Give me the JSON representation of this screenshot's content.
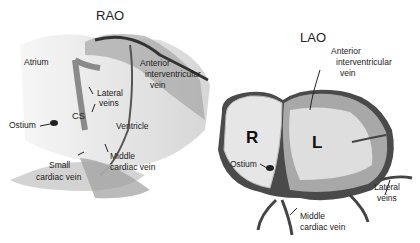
{
  "panels": [
    {
      "title": "RAO",
      "labels": {
        "atrium": "Atrium",
        "anterior_iv_vein_1": "Anterior",
        "anterior_iv_vein_2": "interventricular",
        "anterior_iv_vein_3": "vein",
        "lateral_veins_1": "Lateral",
        "lateral_veins_2": "veins",
        "cs": "CS",
        "ostium": "Ostium",
        "ventricle": "Ventricle",
        "middle_cardiac_1": "Middle",
        "middle_cardiac_2": "cardiac vein",
        "small_cardiac_1": "Small",
        "small_cardiac_2": "cardiac vein"
      }
    },
    {
      "title": "LAO",
      "labels": {
        "anterior_iv_vein_1": "Anterior",
        "anterior_iv_vein_2": "interventricular",
        "anterior_iv_vein_3": "vein",
        "right": "R",
        "left": "L",
        "ostium": "Ostium",
        "lateral_veins_1": "Lateral",
        "lateral_veins_2": "veins",
        "middle_cardiac_1": "Middle",
        "middle_cardiac_2": "cardiac vein"
      }
    }
  ]
}
